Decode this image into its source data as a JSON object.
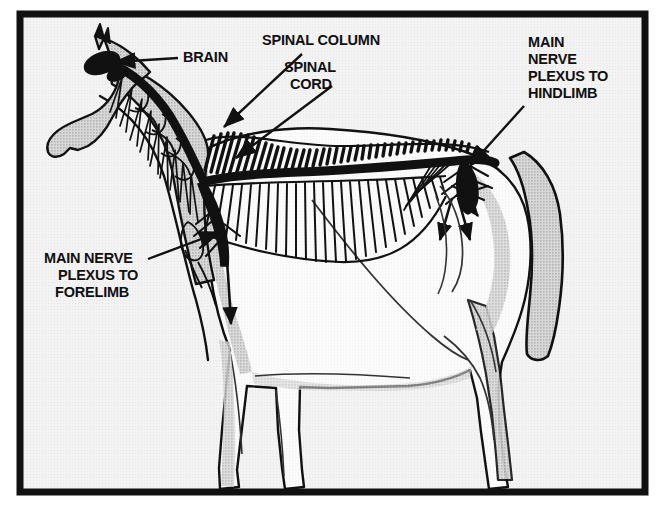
{
  "figure": {
    "view": "left lateral profile"
  },
  "frame": {
    "border_color": "#111111",
    "border_width_px": 7,
    "inner_background": "#f1f1f1",
    "x": 20,
    "y": 14,
    "width": 625,
    "height": 478
  },
  "palette": {
    "ink": "#111111",
    "body_fill": "#fcfcfc",
    "shade_fill": "#c9c9c9",
    "shade_fill_light": "#dedede",
    "background": "#f1f1f1",
    "page": "#ffffff"
  },
  "labels": [
    {
      "id": "brain",
      "name": "brain-label",
      "lines": [
        "BRAIN"
      ],
      "x": 183,
      "y": 62,
      "anchor": "start",
      "leader": {
        "from": [
          178,
          58
        ],
        "to": [
          108,
          62
        ],
        "arrow": true
      }
    },
    {
      "id": "spinal-column",
      "name": "spinal-column-label",
      "lines": [
        "SPINAL COLUMN"
      ],
      "x": 262,
      "y": 45,
      "anchor": "start",
      "leader": {
        "from": [
          300,
          54
        ],
        "to": [
          222,
          128
        ],
        "arrow": true
      }
    },
    {
      "id": "spinal-cord",
      "name": "spinal-cord-label",
      "lines": [
        "SPINAL",
        "CORD"
      ],
      "x": 279,
      "y": 72,
      "anchor": "start",
      "leader": {
        "from": [
          330,
          84
        ],
        "to": [
          233,
          160
        ],
        "arrow": true
      }
    },
    {
      "id": "main-nerve-plexus-hindlimb",
      "name": "main-nerve-plexus-hindlimb-label",
      "lines": [
        "MAIN",
        "NERVE",
        "PLEXUS TO",
        "HINDLIMB"
      ],
      "x": 528,
      "y": 47,
      "anchor": "start",
      "leader": {
        "from": [
          524,
          105
        ],
        "to": [
          466,
          168
        ],
        "arrow": true
      }
    },
    {
      "id": "main-nerve-plexus-forelimb",
      "name": "main-nerve-plexus-forelimb-label",
      "lines": [
        "MAIN NERVE",
        "PLEXUS TO",
        "FORELIMB"
      ],
      "x": 44,
      "y": 263,
      "anchor": "start",
      "leader": {
        "from": [
          146,
          259
        ],
        "to": [
          222,
          233
        ],
        "arrow": true
      }
    }
  ],
  "anatomy": {
    "structures": [
      "brain",
      "spinal cord",
      "spinal column (vertebrae)",
      "cervical nerve roots",
      "brachial plexus (forelimb)",
      "lumbosacral plexus (hindlimb)",
      "ribs",
      "peripheral nerve branches"
    ],
    "nerve_arrow_count": 5
  }
}
